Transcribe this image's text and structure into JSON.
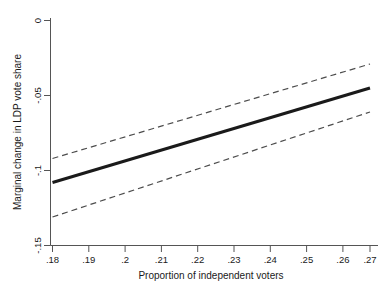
{
  "chart_data": {
    "type": "line",
    "title": "",
    "subtitle": "",
    "xlabel": "Proportion of independent voters",
    "ylabel": "Marginal change in LDP vote share",
    "xlim": [
      0.18,
      0.27
    ],
    "ylim": [
      -0.15,
      0.0
    ],
    "grid": false,
    "legend_position": "none",
    "xticks": [
      0.18,
      0.19,
      0.2,
      0.21,
      0.22,
      0.23,
      0.24,
      0.25,
      0.26,
      0.27
    ],
    "xticklabels": [
      ".18",
      ".19",
      ".2",
      ".21",
      ".22",
      ".23",
      ".24",
      ".25",
      ".26",
      ".27"
    ],
    "yticks": [
      0.0,
      -0.05,
      -0.1,
      -0.15
    ],
    "yticklabels": [
      "0",
      "-.05",
      "-.1",
      "-.15"
    ],
    "series": [
      {
        "name": "Marginal effect",
        "style": "solid",
        "color": "#1a1a1a",
        "width": 3,
        "x": [
          0.18,
          0.27
        ],
        "values": [
          -0.108,
          -0.045
        ]
      },
      {
        "name": "Upper 95% confidence bound",
        "style": "dashed",
        "color": "#4d4d4d",
        "width": 1.2,
        "x": [
          0.18,
          0.27
        ],
        "values": [
          -0.092,
          -0.029
        ]
      },
      {
        "name": "Lower 95% confidence bound",
        "style": "dashed",
        "color": "#4d4d4d",
        "width": 1.2,
        "x": [
          0.18,
          0.27
        ],
        "values": [
          -0.131,
          -0.061
        ]
      }
    ],
    "annotations": []
  },
  "axes": {
    "x_title": "Proportion of independent voters",
    "y_title": "Marginal change in LDP vote share",
    "x_tick_labels": [
      ".18",
      ".19",
      ".2",
      ".21",
      ".22",
      ".23",
      ".24",
      ".25",
      ".26",
      ".27"
    ],
    "y_tick_labels": [
      "0",
      "-.05",
      "-.1",
      "-.15"
    ],
    "axis_color": "#555555"
  }
}
